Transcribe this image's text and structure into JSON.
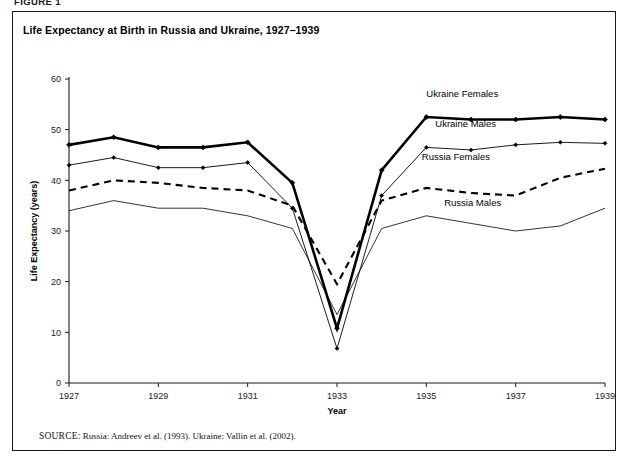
{
  "figure": {
    "label": "FIGURE 1",
    "title": "Life Expectancy at Birth in Russia and Ukraine, 1927–1939",
    "source_keyword": "SOURCE:",
    "source_text": "Russia: Andreev et al. (1993). Ukraine: Vallin et al. (2002)."
  },
  "chart_data": {
    "type": "line",
    "title": "Life Expectancy at Birth in Russia and Ukraine, 1927–1939",
    "xlabel": "Year",
    "ylabel": "Life Expectancy (years)",
    "xlim": [
      1927,
      1939
    ],
    "ylim": [
      0,
      60
    ],
    "ytick_step": 10,
    "yticks": [
      "0",
      "10",
      "20",
      "30",
      "40",
      "50",
      "60"
    ],
    "xticks": [
      "1927",
      "1929",
      "1931",
      "1933",
      "1935",
      "1937",
      "1939"
    ],
    "x": [
      1927,
      1928,
      1929,
      1930,
      1931,
      1932,
      1933,
      1934,
      1935,
      1936,
      1937,
      1938,
      1939
    ],
    "grid": false,
    "legend_position": "inline-right",
    "series": [
      {
        "name": "Ukraine Females",
        "style": "thick-solid-markers",
        "color": "#000000",
        "label_x": 1935.0,
        "label_y": 56.5,
        "values": [
          47.0,
          48.5,
          46.5,
          46.5,
          47.5,
          39.5,
          10.8,
          42.0,
          52.5,
          52.0,
          52.0,
          52.5,
          52.0
        ]
      },
      {
        "name": "Ukraine Males",
        "style": "thin-solid-markers",
        "color": "#000000",
        "label_x": 1935.2,
        "label_y": 50.5,
        "values": [
          43.0,
          44.5,
          42.5,
          42.5,
          43.5,
          34.5,
          6.8,
          37.0,
          46.5,
          46.0,
          47.0,
          47.5,
          47.3
        ]
      },
      {
        "name": "Russia Females",
        "style": "dashed",
        "color": "#000000",
        "label_x": 1934.9,
        "label_y": 44.0,
        "values": [
          38.0,
          40.0,
          39.5,
          38.5,
          38.0,
          35.0,
          19.5,
          36.0,
          38.5,
          37.5,
          37.0,
          40.5,
          42.3
        ]
      },
      {
        "name": "Russia Males",
        "style": "thin-solid",
        "color": "#000000",
        "label_x": 1935.4,
        "label_y": 35.0,
        "values": [
          34.0,
          36.0,
          34.5,
          34.5,
          33.0,
          30.5,
          13.5,
          30.5,
          33.0,
          31.5,
          30.0,
          31.0,
          34.5
        ]
      }
    ]
  }
}
